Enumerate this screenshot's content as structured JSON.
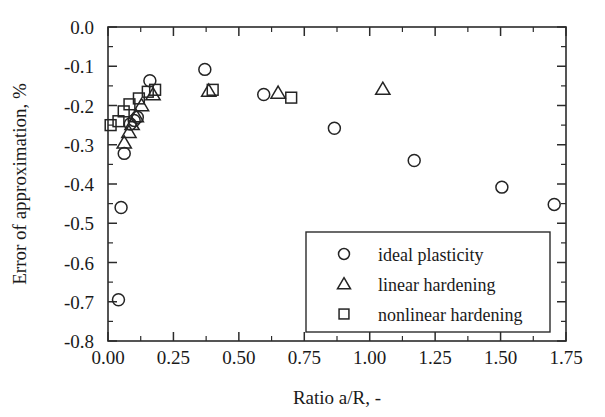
{
  "chart_data": {
    "type": "scatter",
    "title": "",
    "xlabel": "Ratio a/R, -",
    "ylabel": "Error of approximation, %",
    "xlim": [
      0.0,
      1.75
    ],
    "ylim": [
      -0.8,
      0.0
    ],
    "xticks": [
      0.0,
      0.25,
      0.5,
      0.75,
      1.0,
      1.25,
      1.5,
      1.75
    ],
    "xticklabels": [
      "0.00",
      "0.25",
      "0.50",
      "0.75",
      "1.00",
      "1.25",
      "1.50",
      "1.75"
    ],
    "yticks": [
      -0.8,
      -0.7,
      -0.6,
      -0.5,
      -0.4,
      -0.3,
      -0.2,
      -0.1,
      0.0
    ],
    "yticklabels": [
      "-0.8",
      "-0.7",
      "-0.6",
      "-0.5",
      "-0.4",
      "-0.3",
      "-0.2",
      "-0.1",
      "0.0"
    ],
    "x_minor_ticks_per_interval": 1,
    "y_minor_ticks_per_interval": 1,
    "grid": false,
    "legend_position": "bottom-right",
    "series": [
      {
        "name": "ideal plasticity",
        "marker": "circle",
        "points": [
          [
            0.04,
            -0.695
          ],
          [
            0.05,
            -0.46
          ],
          [
            0.062,
            -0.322
          ],
          [
            0.085,
            -0.247
          ],
          [
            0.1,
            -0.238
          ],
          [
            0.112,
            -0.23
          ],
          [
            0.16,
            -0.137
          ],
          [
            0.37,
            -0.108
          ],
          [
            0.595,
            -0.172
          ],
          [
            0.865,
            -0.258
          ],
          [
            1.17,
            -0.34
          ],
          [
            1.505,
            -0.408
          ],
          [
            1.705,
            -0.452
          ]
        ]
      },
      {
        "name": "linear hardening",
        "marker": "triangle",
        "points": [
          [
            0.062,
            -0.295
          ],
          [
            0.08,
            -0.268
          ],
          [
            0.092,
            -0.248
          ],
          [
            0.108,
            -0.228
          ],
          [
            0.128,
            -0.2
          ],
          [
            0.172,
            -0.172
          ],
          [
            0.385,
            -0.163
          ],
          [
            0.65,
            -0.168
          ],
          [
            1.05,
            -0.158
          ]
        ]
      },
      {
        "name": "nonlinear hardening",
        "marker": "square",
        "points": [
          [
            0.01,
            -0.25
          ],
          [
            0.04,
            -0.24
          ],
          [
            0.06,
            -0.215
          ],
          [
            0.082,
            -0.197
          ],
          [
            0.118,
            -0.182
          ],
          [
            0.152,
            -0.165
          ],
          [
            0.18,
            -0.16
          ],
          [
            0.4,
            -0.16
          ],
          [
            0.7,
            -0.18
          ]
        ]
      }
    ]
  },
  "legend": {
    "entries": [
      {
        "label": "ideal plasticity",
        "marker": "circle"
      },
      {
        "label": "linear hardening",
        "marker": "triangle"
      },
      {
        "label": "nonlinear hardening",
        "marker": "square"
      }
    ]
  }
}
